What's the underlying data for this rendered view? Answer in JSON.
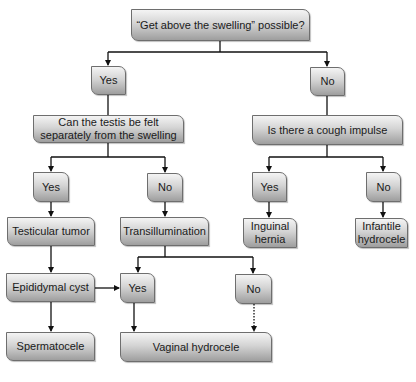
{
  "diagram": {
    "type": "flowchart",
    "topic": "Scrotal swelling evaluation",
    "nodes": {
      "root": "“Get above the swelling” possible?",
      "yes1": "Yes",
      "no1": "No",
      "testis_question": "Can the testis be felt separately from the swelling",
      "cough_question": "Is there a cough impulse",
      "testis_yes": "Yes",
      "testis_no": "No",
      "cough_yes": "Yes",
      "cough_no": "No",
      "testicular_tumor": "Testicular tumor",
      "transillumination": "Transillumination",
      "inguinal_hernia": "Inguinal hernia",
      "infantile_hydrocele": "Infantile hydrocele",
      "epididymal_cyst": "Epididymal cyst",
      "trans_yes": "Yes",
      "trans_no": "No",
      "spermatocele": "Spermatocele",
      "vaginal_hydrocele": "Vaginal hydrocele"
    },
    "edges": [
      {
        "from": "root",
        "to": "yes1"
      },
      {
        "from": "root",
        "to": "no1"
      },
      {
        "from": "yes1",
        "to": "testis_question"
      },
      {
        "from": "no1",
        "to": "cough_question"
      },
      {
        "from": "testis_question",
        "to": "testis_yes"
      },
      {
        "from": "testis_question",
        "to": "testis_no"
      },
      {
        "from": "cough_question",
        "to": "cough_yes"
      },
      {
        "from": "cough_question",
        "to": "cough_no"
      },
      {
        "from": "testis_yes",
        "to": "testicular_tumor"
      },
      {
        "from": "testis_no",
        "to": "transillumination"
      },
      {
        "from": "cough_yes",
        "to": "inguinal_hernia"
      },
      {
        "from": "cough_no",
        "to": "infantile_hydrocele"
      },
      {
        "from": "testicular_tumor",
        "to": "epididymal_cyst"
      },
      {
        "from": "transillumination",
        "to": "trans_yes"
      },
      {
        "from": "transillumination",
        "to": "trans_no"
      },
      {
        "from": "epididymal_cyst",
        "to": "trans_yes"
      },
      {
        "from": "epididymal_cyst",
        "to": "spermatocele"
      },
      {
        "from": "trans_yes",
        "to": "vaginal_hydrocele"
      },
      {
        "from": "trans_no",
        "to": "vaginal_hydrocele",
        "style": "dotted"
      }
    ],
    "colors": {
      "node_top": "#f4f4f4",
      "node_bottom": "#9e9e9e",
      "border": "#6e6e6e",
      "line": "#111111"
    }
  }
}
